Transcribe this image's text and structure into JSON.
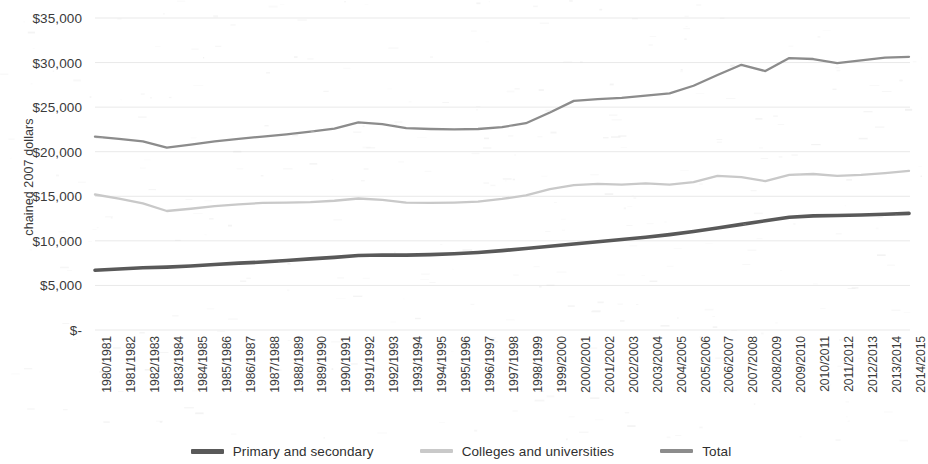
{
  "chart_data": {
    "type": "line",
    "title": "",
    "xlabel": "",
    "ylabel": "chained 2007 dollars",
    "ylim": [
      0,
      35000
    ],
    "ytick_labels": [
      "$35,000",
      "$30,000",
      "$25,000",
      "$20,000",
      "$15,000",
      "$10,000",
      "$5,000",
      "$-"
    ],
    "ytick_values": [
      35000,
      30000,
      25000,
      20000,
      15000,
      10000,
      5000,
      0
    ],
    "grid": "horizontal",
    "legend_position": "bottom",
    "categories": [
      "1980/1981",
      "1981/1982",
      "1982/1983",
      "1983/1984",
      "1984/1985",
      "1985/1986",
      "1986/1987",
      "1987/1988",
      "1988/1989",
      "1989/1990",
      "1990/1991",
      "1991/1992",
      "1992/1993",
      "1993/1994",
      "1994/1995",
      "1995/1996",
      "1996/1997",
      "1997/1998",
      "1998/1999",
      "1999/2000",
      "2000/2001",
      "2001/2002",
      "2002/2003",
      "2003/2004",
      "2004/2005",
      "2005/2006",
      "2006/2007",
      "2007/2008",
      "2008/2009",
      "2009/2010",
      "2010/2011",
      "2011/2012",
      "2012/2013",
      "2013/2014",
      "2014/2015"
    ],
    "series": [
      {
        "name": "Primary and secondary",
        "color": "#595959",
        "values": [
          6700,
          6850,
          6980,
          7050,
          7180,
          7350,
          7500,
          7620,
          7800,
          7980,
          8150,
          8350,
          8420,
          8400,
          8450,
          8550,
          8700,
          8900,
          9150,
          9400,
          9650,
          9900,
          10150,
          10400,
          10700,
          11050,
          11450,
          11850,
          12250,
          12650,
          12800,
          12850,
          12900,
          12980,
          13080
        ]
      },
      {
        "name": "Colleges and universities",
        "color": "#c9c9c9",
        "values": [
          15200,
          14750,
          14200,
          13350,
          13600,
          13900,
          14100,
          14250,
          14300,
          14350,
          14500,
          14750,
          14600,
          14300,
          14250,
          14300,
          14400,
          14700,
          15100,
          15800,
          16250,
          16400,
          16300,
          16450,
          16300,
          16600,
          17300,
          17150,
          16700,
          17400,
          17500,
          17300,
          17400,
          17600,
          17850
        ]
      },
      {
        "name": "Total",
        "color": "#8c8c8c",
        "values": [
          21700,
          21450,
          21150,
          20450,
          20800,
          21150,
          21450,
          21700,
          21950,
          22250,
          22600,
          23300,
          23100,
          22650,
          22550,
          22500,
          22550,
          22750,
          23200,
          24400,
          25700,
          25900,
          26050,
          26300,
          26550,
          27400,
          28600,
          29750,
          29050,
          30500,
          30400,
          29950,
          30250,
          30550,
          30650
        ]
      }
    ]
  },
  "legend": {
    "items": [
      {
        "label": "Primary and secondary",
        "color": "#595959"
      },
      {
        "label": "Colleges and universities",
        "color": "#c9c9c9"
      },
      {
        "label": "Total",
        "color": "#8c8c8c"
      }
    ]
  }
}
